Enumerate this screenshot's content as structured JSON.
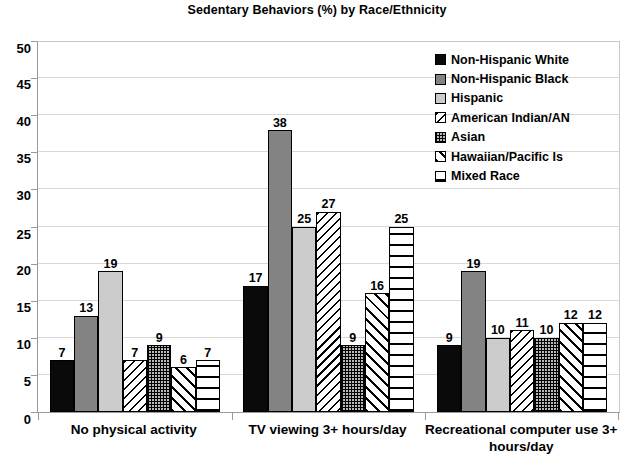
{
  "chart_data": {
    "type": "bar",
    "title": "Sedentary Behaviors (%) by Race/Ethnicity",
    "xlabel": "",
    "ylabel": "",
    "ylim": [
      0,
      50
    ],
    "ytick_step": 5,
    "yticks": [
      "0",
      "5",
      "10",
      "15",
      "20",
      "25",
      "30",
      "35",
      "40",
      "45",
      "50"
    ],
    "grid": true,
    "legend_position": "upper right",
    "categories": [
      "No physical activity",
      "TV viewing 3+ hours/day",
      "Recreational computer use 3+ hours/day"
    ],
    "series": [
      {
        "name": "Non-Hispanic White",
        "pattern": "solid-black",
        "values": [
          7,
          17,
          9
        ]
      },
      {
        "name": "Non-Hispanic Black",
        "pattern": "medium-gray",
        "values": [
          13,
          38,
          19
        ]
      },
      {
        "name": "Hispanic",
        "pattern": "light-gray",
        "values": [
          19,
          25,
          10
        ]
      },
      {
        "name": "American Indian/AN",
        "pattern": "backslash-hatch",
        "values": [
          7,
          27,
          11
        ]
      },
      {
        "name": "Asian",
        "pattern": "checkered-dots",
        "values": [
          9,
          9,
          10
        ]
      },
      {
        "name": "Hawaiian/Pacific Is",
        "pattern": "forward-hatch",
        "values": [
          6,
          16,
          12
        ]
      },
      {
        "name": "Mixed Race",
        "pattern": "horizontal-lines",
        "values": [
          7,
          25,
          12
        ]
      }
    ],
    "colors": {
      "solid-black": "#0a0a0a",
      "medium-gray": "#838383",
      "light-gray": "#cccccc",
      "gridline": "#d8d8d8",
      "axis": "#9a9a9a",
      "text": "#000000"
    }
  },
  "legend": {
    "items": [
      "Non-Hispanic White",
      "Non-Hispanic Black",
      "Hispanic",
      "American Indian/AN",
      "Asian",
      "Hawaiian/Pacific Is",
      "Mixed Race"
    ]
  }
}
